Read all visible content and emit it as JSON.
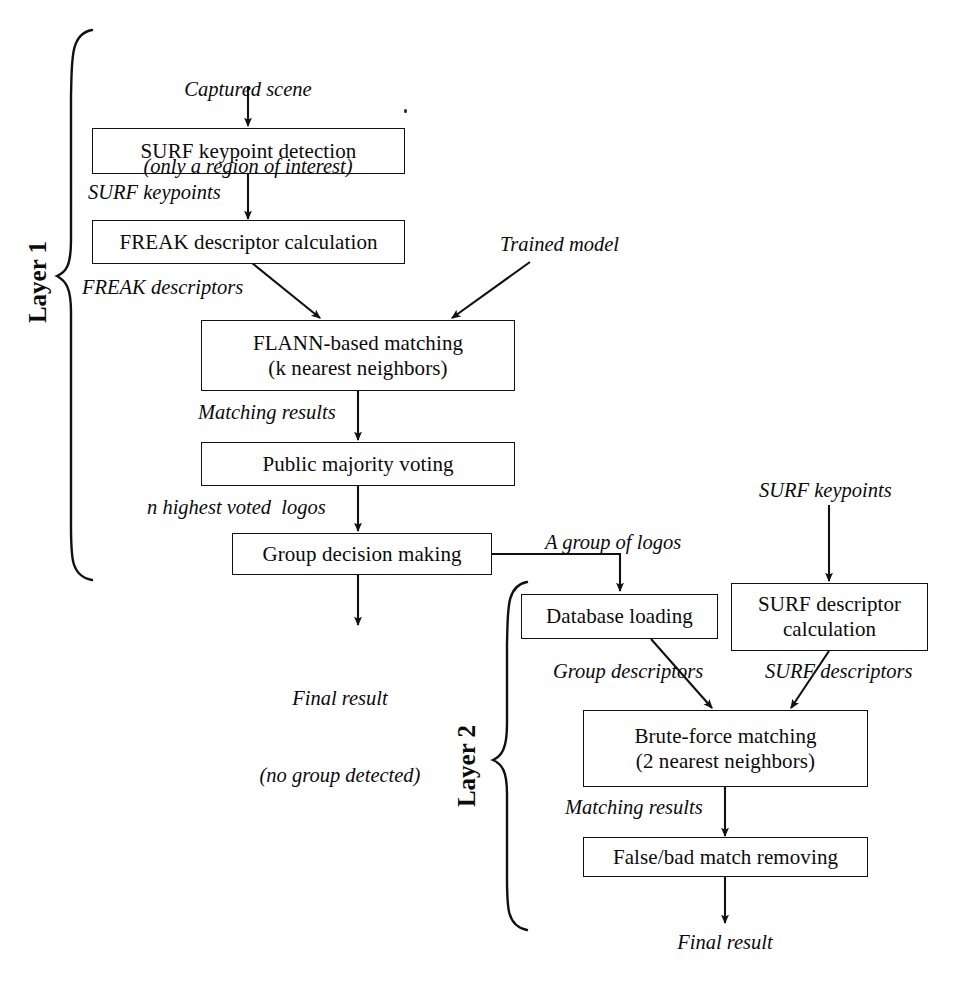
{
  "figure": {
    "type": "flowchart",
    "orientation": "two-layer vertical pipeline",
    "background_color": "#ffffff",
    "line_color": "#111111"
  },
  "layers": [
    {
      "id": "layer1",
      "label": "Layer 1"
    },
    {
      "id": "layer2",
      "label": "Layer 2"
    }
  ],
  "nodes": [
    {
      "id": "surf_kp_detect",
      "label": "SURF keypoint detection"
    },
    {
      "id": "freak_desc_calc",
      "label": "FREAK descriptor calculation"
    },
    {
      "id": "flann_match_l1",
      "label": "FLANN-based matching"
    },
    {
      "id": "flann_match_l2",
      "label": "(k nearest neighbors)"
    },
    {
      "id": "public_vote",
      "label": "Public majority voting"
    },
    {
      "id": "group_decision",
      "label": "Group decision making"
    },
    {
      "id": "db_loading",
      "label": "Database loading"
    },
    {
      "id": "surf_desc_l1",
      "label": "SURF descriptor"
    },
    {
      "id": "surf_desc_l2",
      "label": "calculation"
    },
    {
      "id": "brute_force_l1",
      "label": "Brute-force matching"
    },
    {
      "id": "brute_force_l2",
      "label": "(2 nearest neighbors)"
    },
    {
      "id": "false_match_rm",
      "label": "False/bad match removing"
    }
  ],
  "edge_labels": {
    "captured_scene_l1": "Captured scene",
    "captured_scene_l2": "(only a region of interest)",
    "surf_keypoints_top": "SURF keypoints",
    "freak_descriptors": "FREAK descriptors",
    "trained_model": "Trained model",
    "matching_results_l1": "Matching results",
    "n_highest_voted_logos": "n highest voted  logos",
    "final_result_l1_a": "Final result",
    "final_result_l1_b": "(no group detected)",
    "a_group_of_logos": "A group of logos",
    "surf_keypoints_right": "SURF keypoints",
    "group_descriptors": "Group descriptors",
    "surf_descriptors": "SURF descriptors",
    "matching_results_l2": "Matching results",
    "final_result_l2": "Final result"
  }
}
